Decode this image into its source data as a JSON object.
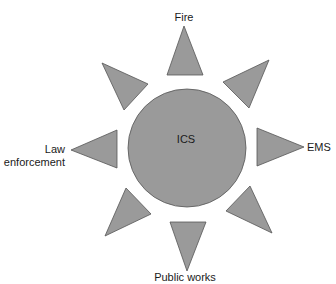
{
  "diagram": {
    "center": {
      "label": "ICS",
      "shape": "circle",
      "color": "#9a9a9a"
    },
    "rays": [
      {
        "position": "top",
        "label": "Fire"
      },
      {
        "position": "top-right",
        "label": ""
      },
      {
        "position": "right",
        "label": "EMS"
      },
      {
        "position": "bottom-right",
        "label": ""
      },
      {
        "position": "bottom",
        "label": "Public works"
      },
      {
        "position": "bottom-left",
        "label": ""
      },
      {
        "position": "left",
        "label_line1": "Law",
        "label_line2": "enforcement"
      },
      {
        "position": "top-left",
        "label": ""
      }
    ],
    "colors": {
      "fill": "#9a9a9a",
      "stroke": "#555555",
      "text": "#1a1a1a"
    }
  }
}
